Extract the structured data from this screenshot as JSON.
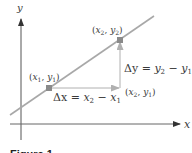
{
  "diagram": {
    "axes": {
      "x_label": "x",
      "y_label": "y"
    },
    "points": [
      {
        "id": "p1",
        "label_x": "x",
        "label_x_sub": "1",
        "label_y": "y",
        "label_y_sub": "1"
      },
      {
        "id": "p2",
        "label_x": "x",
        "label_x_sub": "2",
        "label_y": "y",
        "label_y_sub": "2"
      },
      {
        "id": "corner",
        "label_x": "x",
        "label_x_sub": "2",
        "label_y": "y",
        "label_y_sub": "1"
      }
    ],
    "delta_x": {
      "lhs": "Δx",
      "eq": " = ",
      "a": "x",
      "a_sub": "2",
      "minus": " − ",
      "b": "x",
      "b_sub": "1"
    },
    "delta_y": {
      "lhs": "Δy",
      "eq": " = ",
      "a": "y",
      "a_sub": "2",
      "minus": " − ",
      "b": "y",
      "b_sub": "1"
    },
    "caption": "Figure 1",
    "colors": {
      "axis": "#555555",
      "line": "#a8a8a8",
      "arrow": "#b0b0b0",
      "point": "#8a8a8a",
      "text": "#3a3a3a"
    }
  }
}
